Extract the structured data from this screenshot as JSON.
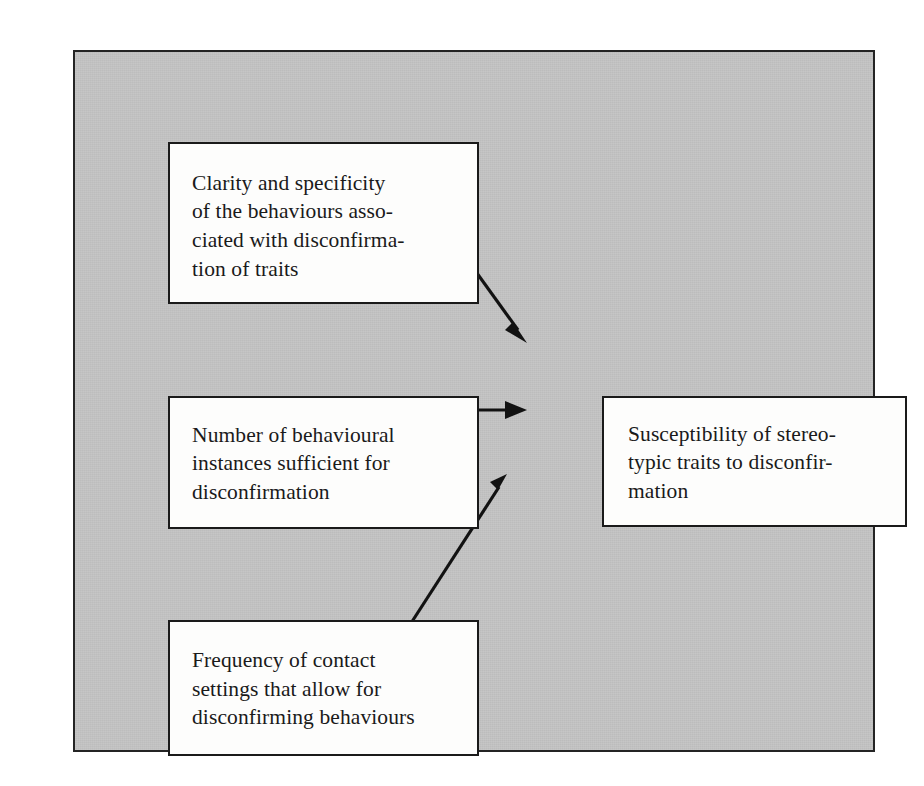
{
  "figure": {
    "type": "flow-diagram",
    "orientation": "left-to-right",
    "background_color": "#c4c4c4",
    "box_fill_color": "#fdfdfc",
    "line_color": "#121212",
    "nodes": [
      {
        "id": "clarity",
        "position": "top-left",
        "label": "Clarity and specificity\nof the behaviours asso-\nciated with disconfirma-\ntion of traits"
      },
      {
        "id": "number",
        "position": "middle-left",
        "label": "Number of behavioural\ninstances sufficient for\ndisconfirmation"
      },
      {
        "id": "frequency",
        "position": "bottom-left",
        "label": "Frequency of contact\nsettings that allow for\ndisconfirming behaviours"
      },
      {
        "id": "susceptibility",
        "position": "middle-right",
        "label": "Susceptibility of stereo-\ntypic traits to disconfir-\nmation"
      }
    ],
    "edges": [
      {
        "id": "clarity-to-susceptibility",
        "from": "clarity",
        "to": "susceptibility",
        "style": "solid-arrow",
        "direction": "down-right"
      },
      {
        "id": "number-to-susceptibility",
        "from": "number",
        "to": "susceptibility",
        "style": "solid-arrow",
        "direction": "right"
      },
      {
        "id": "frequency-to-susceptibility",
        "from": "frequency",
        "to": "susceptibility",
        "style": "solid-arrow",
        "direction": "up-right"
      }
    ]
  }
}
